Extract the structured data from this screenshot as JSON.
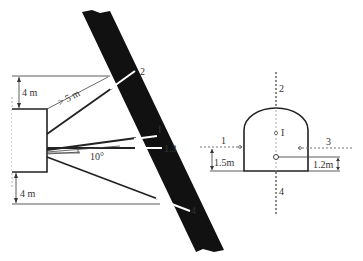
{
  "diagram": {
    "left_view": {
      "dimensions": {
        "top_offset": "4 m",
        "bottom_offset": "4 m",
        "min_distance": "> 5 m",
        "angle": "10°"
      },
      "hole_labels": {
        "h2": "2",
        "hI": "I",
        "h13": "1.3",
        "h4": "4"
      }
    },
    "right_view": {
      "hole_labels": {
        "h1": "1",
        "h2": "2",
        "h3": "3",
        "h4": "4",
        "hI": "I"
      },
      "dimensions": {
        "left_height": "1.5m",
        "right_height": "1.2m"
      }
    },
    "colors": {
      "rock_band": "#111111",
      "lines": "#222222",
      "background": "#ffffff"
    }
  }
}
